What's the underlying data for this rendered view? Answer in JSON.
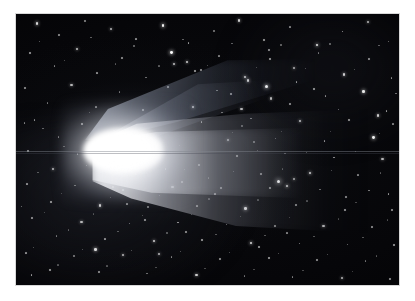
{
  "page": {
    "background_color": "#ffffff",
    "width": 415,
    "height": 301
  },
  "photo": {
    "subject": "comet",
    "description": "Long-exposure astrophotograph of a bright comet with a brilliant coma and two tails against a dense star field",
    "frame": {
      "left": 16,
      "top": 14,
      "width": 383,
      "height": 271
    },
    "sky_color": "#030305",
    "comet_color": "#ffffff",
    "artifacts": {
      "scanline_color": "#80848e"
    }
  },
  "comet": {
    "coma": {
      "cx_pct": 28,
      "cy_pct": 50,
      "color": "#ffffff"
    },
    "tails": [
      {
        "name": "dust-tail",
        "direction": "right",
        "brightness": "bright"
      },
      {
        "name": "ion-tail",
        "direction": "upper-right",
        "brightness": "faint"
      }
    ]
  },
  "starfield": {
    "count": 260,
    "color": "#ffffff",
    "stars": [
      [
        5.2,
        3.1,
        1.6,
        0.85
      ],
      [
        11.0,
        7.4,
        1.2,
        0.6
      ],
      [
        17.8,
        2.2,
        1.0,
        0.5
      ],
      [
        24.5,
        5.0,
        1.4,
        0.7
      ],
      [
        31.2,
        8.8,
        1.1,
        0.55
      ],
      [
        38.0,
        3.6,
        1.8,
        0.95
      ],
      [
        44.8,
        10.2,
        1.2,
        0.6
      ],
      [
        51.5,
        5.9,
        1.0,
        0.45
      ],
      [
        58.0,
        2.0,
        1.5,
        0.8
      ],
      [
        64.6,
        9.3,
        1.3,
        0.65
      ],
      [
        71.4,
        4.4,
        1.1,
        0.5
      ],
      [
        78.2,
        11.0,
        1.7,
        0.9
      ],
      [
        85.0,
        6.1,
        1.2,
        0.6
      ],
      [
        91.6,
        2.7,
        1.4,
        0.7
      ],
      [
        97.0,
        9.8,
        1.0,
        0.45
      ],
      [
        3.4,
        14.2,
        1.3,
        0.65
      ],
      [
        9.8,
        19.0,
        1.0,
        0.5
      ],
      [
        15.6,
        12.5,
        1.5,
        0.75
      ],
      [
        21.0,
        21.4,
        1.1,
        0.55
      ],
      [
        27.5,
        16.0,
        1.2,
        0.6
      ],
      [
        33.8,
        23.1,
        1.0,
        0.45
      ],
      [
        40.2,
        13.7,
        1.9,
        1.0
      ],
      [
        46.6,
        20.5,
        1.3,
        0.65
      ],
      [
        52.8,
        15.2,
        1.1,
        0.5
      ],
      [
        59.4,
        22.8,
        1.6,
        0.85
      ],
      [
        65.8,
        12.9,
        1.2,
        0.6
      ],
      [
        72.2,
        19.6,
        1.4,
        0.7
      ],
      [
        78.8,
        14.1,
        1.0,
        0.45
      ],
      [
        85.4,
        21.9,
        1.5,
        0.8
      ],
      [
        92.0,
        16.4,
        1.2,
        0.6
      ],
      [
        97.8,
        23.4,
        1.1,
        0.55
      ],
      [
        2.1,
        27.0,
        1.2,
        0.6
      ],
      [
        8.0,
        32.6,
        1.0,
        0.45
      ],
      [
        14.2,
        25.8,
        1.4,
        0.7
      ],
      [
        20.6,
        34.0,
        1.1,
        0.5
      ],
      [
        26.8,
        28.4,
        1.0,
        0.45
      ],
      [
        32.9,
        35.2,
        1.3,
        0.65
      ],
      [
        39.4,
        26.5,
        1.2,
        0.6
      ],
      [
        45.9,
        33.8,
        1.6,
        0.85
      ],
      [
        52.2,
        27.9,
        1.1,
        0.5
      ],
      [
        58.6,
        34.6,
        1.4,
        0.7
      ],
      [
        64.9,
        26.1,
        2.0,
        1.0
      ],
      [
        71.3,
        33.0,
        1.2,
        0.6
      ],
      [
        77.6,
        27.4,
        1.3,
        0.65
      ],
      [
        84.0,
        34.9,
        1.0,
        0.45
      ],
      [
        90.4,
        28.0,
        1.7,
        0.9
      ],
      [
        96.5,
        35.5,
        1.2,
        0.6
      ],
      [
        4.6,
        38.9,
        1.1,
        0.55
      ],
      [
        10.9,
        45.2,
        1.0,
        0.45
      ],
      [
        17.0,
        40.1,
        1.3,
        0.65
      ],
      [
        48.2,
        39.4,
        1.2,
        0.6
      ],
      [
        55.0,
        46.0,
        1.4,
        0.7
      ],
      [
        61.2,
        38.2,
        1.1,
        0.5
      ],
      [
        67.5,
        45.6,
        1.0,
        0.45
      ],
      [
        73.9,
        39.0,
        1.5,
        0.8
      ],
      [
        80.3,
        46.4,
        1.2,
        0.6
      ],
      [
        86.6,
        38.6,
        1.3,
        0.65
      ],
      [
        93.0,
        45.0,
        1.8,
        0.95
      ],
      [
        98.2,
        40.4,
        1.1,
        0.5
      ],
      [
        3.0,
        50.2,
        1.2,
        0.6
      ],
      [
        9.4,
        56.8,
        1.4,
        0.7
      ],
      [
        15.8,
        51.4,
        1.0,
        0.45
      ],
      [
        22.0,
        58.0,
        1.1,
        0.55
      ],
      [
        57.4,
        52.0,
        1.3,
        0.65
      ],
      [
        63.8,
        58.6,
        1.2,
        0.6
      ],
      [
        70.0,
        51.2,
        1.0,
        0.45
      ],
      [
        76.4,
        58.2,
        1.6,
        0.85
      ],
      [
        82.8,
        52.6,
        1.2,
        0.6
      ],
      [
        89.0,
        59.0,
        1.1,
        0.5
      ],
      [
        95.4,
        53.2,
        1.4,
        0.7
      ],
      [
        2.6,
        62.4,
        1.1,
        0.55
      ],
      [
        8.8,
        68.9,
        1.3,
        0.65
      ],
      [
        15.2,
        63.0,
        1.0,
        0.45
      ],
      [
        21.6,
        70.2,
        1.5,
        0.8
      ],
      [
        27.8,
        64.6,
        1.2,
        0.6
      ],
      [
        34.2,
        71.0,
        1.0,
        0.45
      ],
      [
        40.6,
        63.4,
        1.4,
        0.7
      ],
      [
        47.0,
        70.6,
        1.1,
        0.5
      ],
      [
        53.2,
        64.0,
        1.2,
        0.6
      ],
      [
        59.6,
        71.4,
        1.7,
        0.9
      ],
      [
        66.0,
        63.8,
        1.3,
        0.65
      ],
      [
        68.2,
        61.2,
        2.1,
        1.0
      ],
      [
        70.5,
        63.0,
        1.6,
        0.85
      ],
      [
        72.4,
        60.4,
        1.4,
        0.7
      ],
      [
        72.8,
        70.0,
        1.2,
        0.6
      ],
      [
        79.2,
        64.4,
        1.0,
        0.45
      ],
      [
        85.6,
        71.8,
        1.3,
        0.65
      ],
      [
        92.0,
        64.8,
        1.1,
        0.5
      ],
      [
        98.0,
        72.0,
        1.2,
        0.6
      ],
      [
        4.0,
        75.0,
        1.2,
        0.6
      ],
      [
        10.4,
        81.6,
        1.0,
        0.45
      ],
      [
        16.8,
        76.2,
        1.4,
        0.7
      ],
      [
        23.0,
        82.8,
        1.1,
        0.55
      ],
      [
        29.4,
        77.0,
        1.0,
        0.45
      ],
      [
        35.8,
        83.4,
        1.5,
        0.8
      ],
      [
        42.0,
        76.6,
        1.2,
        0.6
      ],
      [
        48.4,
        83.0,
        1.3,
        0.65
      ],
      [
        54.8,
        77.4,
        1.0,
        0.45
      ],
      [
        61.0,
        84.0,
        1.6,
        0.85
      ],
      [
        67.4,
        78.0,
        1.2,
        0.6
      ],
      [
        73.8,
        84.4,
        1.1,
        0.5
      ],
      [
        80.0,
        77.8,
        1.4,
        0.7
      ],
      [
        86.4,
        84.8,
        1.0,
        0.45
      ],
      [
        92.8,
        78.4,
        1.2,
        0.6
      ],
      [
        98.4,
        85.0,
        1.3,
        0.65
      ],
      [
        2.4,
        88.0,
        1.1,
        0.55
      ],
      [
        8.6,
        94.2,
        1.3,
        0.65
      ],
      [
        15.0,
        89.0,
        1.0,
        0.45
      ],
      [
        21.4,
        95.0,
        1.2,
        0.6
      ],
      [
        27.6,
        88.6,
        1.4,
        0.7
      ],
      [
        34.0,
        95.4,
        1.0,
        0.45
      ],
      [
        40.4,
        89.4,
        1.1,
        0.5
      ],
      [
        46.8,
        96.0,
        1.5,
        0.8
      ],
      [
        53.0,
        90.0,
        1.2,
        0.6
      ],
      [
        59.4,
        96.4,
        1.0,
        0.45
      ],
      [
        65.8,
        89.8,
        1.3,
        0.65
      ],
      [
        72.0,
        96.8,
        1.1,
        0.5
      ],
      [
        78.4,
        90.4,
        1.2,
        0.6
      ],
      [
        84.8,
        97.0,
        1.4,
        0.7
      ],
      [
        91.0,
        90.8,
        1.0,
        0.45
      ],
      [
        97.4,
        97.4,
        1.2,
        0.6
      ],
      [
        6.8,
        42.0,
        1.0,
        0.4
      ],
      [
        12.4,
        48.6,
        0.9,
        0.35
      ],
      [
        19.0,
        36.2,
        0.9,
        0.35
      ],
      [
        25.4,
        42.8,
        0.8,
        0.3
      ],
      [
        36.0,
        55.0,
        0.9,
        0.35
      ],
      [
        42.6,
        48.4,
        0.8,
        0.3
      ],
      [
        50.0,
        60.2,
        0.9,
        0.35
      ],
      [
        56.4,
        43.6,
        0.8,
        0.3
      ],
      [
        62.8,
        50.0,
        0.9,
        0.35
      ],
      [
        69.2,
        43.2,
        0.8,
        0.3
      ],
      [
        75.6,
        50.8,
        0.9,
        0.35
      ],
      [
        82.0,
        43.0,
        0.8,
        0.3
      ],
      [
        88.4,
        50.4,
        0.9,
        0.35
      ],
      [
        94.8,
        43.8,
        0.8,
        0.3
      ],
      [
        5.6,
        58.2,
        0.9,
        0.35
      ],
      [
        11.8,
        66.0,
        0.8,
        0.3
      ],
      [
        18.2,
        55.6,
        0.9,
        0.35
      ],
      [
        24.6,
        67.4,
        0.8,
        0.3
      ],
      [
        31.0,
        58.8,
        0.9,
        0.35
      ],
      [
        37.4,
        66.8,
        0.8,
        0.3
      ],
      [
        43.8,
        57.2,
        0.9,
        0.35
      ],
      [
        50.2,
        68.0,
        0.8,
        0.3
      ],
      [
        56.6,
        57.8,
        0.9,
        0.35
      ],
      [
        63.0,
        68.4,
        0.8,
        0.3
      ],
      [
        69.4,
        57.0,
        0.9,
        0.35
      ],
      [
        75.8,
        68.8,
        0.8,
        0.3
      ],
      [
        82.2,
        57.6,
        0.9,
        0.35
      ],
      [
        88.6,
        69.2,
        0.8,
        0.3
      ],
      [
        95.0,
        58.4,
        0.9,
        0.35
      ],
      [
        7.2,
        73.0,
        0.8,
        0.3
      ],
      [
        13.6,
        79.4,
        0.9,
        0.35
      ],
      [
        20.0,
        73.6,
        0.8,
        0.3
      ],
      [
        26.4,
        80.0,
        0.9,
        0.35
      ],
      [
        32.8,
        74.2,
        0.8,
        0.3
      ],
      [
        39.2,
        80.6,
        0.9,
        0.35
      ],
      [
        45.6,
        73.8,
        0.8,
        0.3
      ],
      [
        52.0,
        81.0,
        0.9,
        0.35
      ],
      [
        58.4,
        74.6,
        0.8,
        0.3
      ],
      [
        64.8,
        81.4,
        0.9,
        0.35
      ],
      [
        71.2,
        75.0,
        0.8,
        0.3
      ],
      [
        77.6,
        81.8,
        0.9,
        0.35
      ],
      [
        84.0,
        75.4,
        0.8,
        0.3
      ],
      [
        90.4,
        82.2,
        0.9,
        0.35
      ],
      [
        96.8,
        75.8,
        0.8,
        0.3
      ],
      [
        4.4,
        86.0,
        0.9,
        0.35
      ],
      [
        10.8,
        92.4,
        0.8,
        0.3
      ],
      [
        17.2,
        86.6,
        0.9,
        0.35
      ],
      [
        23.6,
        92.8,
        0.8,
        0.3
      ],
      [
        30.0,
        87.0,
        0.9,
        0.35
      ],
      [
        36.4,
        93.2,
        0.8,
        0.3
      ],
      [
        42.8,
        87.4,
        0.9,
        0.35
      ],
      [
        49.2,
        93.6,
        0.8,
        0.3
      ],
      [
        55.6,
        87.8,
        0.9,
        0.35
      ],
      [
        62.0,
        94.0,
        0.8,
        0.3
      ],
      [
        68.4,
        88.2,
        0.9,
        0.35
      ],
      [
        74.8,
        94.4,
        0.8,
        0.3
      ],
      [
        81.2,
        88.6,
        0.9,
        0.35
      ],
      [
        87.6,
        94.8,
        0.8,
        0.3
      ],
      [
        94.0,
        89.0,
        0.9,
        0.35
      ],
      [
        6.0,
        10.0,
        0.9,
        0.4
      ],
      [
        12.6,
        16.8,
        0.8,
        0.35
      ],
      [
        19.4,
        8.4,
        0.9,
        0.4
      ],
      [
        25.8,
        18.2,
        0.8,
        0.35
      ],
      [
        30.6,
        11.6,
        0.9,
        0.4
      ],
      [
        37.2,
        19.0,
        0.8,
        0.35
      ],
      [
        43.4,
        9.2,
        0.9,
        0.4
      ],
      [
        49.8,
        18.8,
        0.8,
        0.35
      ],
      [
        56.2,
        10.6,
        0.9,
        0.4
      ],
      [
        62.6,
        19.4,
        0.8,
        0.35
      ],
      [
        69.0,
        11.2,
        0.9,
        0.4
      ],
      [
        75.4,
        19.8,
        0.8,
        0.35
      ],
      [
        81.8,
        10.8,
        0.9,
        0.4
      ],
      [
        88.2,
        20.2,
        0.8,
        0.35
      ],
      [
        94.6,
        11.4,
        0.9,
        0.4
      ],
      [
        41.0,
        18.0,
        1.4,
        0.75
      ],
      [
        44.4,
        17.2,
        1.5,
        0.8
      ],
      [
        48.0,
        20.4,
        1.2,
        0.6
      ],
      [
        60.2,
        24.0,
        1.6,
        0.85
      ],
      [
        55.8,
        29.2,
        1.3,
        0.65
      ],
      [
        66.4,
        30.8,
        1.4,
        0.7
      ],
      [
        30.2,
        46.0,
        1.0,
        0.5
      ],
      [
        34.6,
        52.4,
        0.9,
        0.4
      ],
      [
        38.8,
        57.0,
        1.1,
        0.55
      ],
      [
        43.0,
        61.8,
        1.2,
        0.6
      ],
      [
        47.6,
        55.4,
        1.0,
        0.5
      ],
      [
        51.8,
        66.2,
        1.1,
        0.55
      ],
      [
        25.0,
        63.4,
        1.3,
        0.65
      ],
      [
        28.8,
        69.8,
        1.1,
        0.5
      ],
      [
        33.4,
        75.6,
        1.2,
        0.6
      ],
      [
        20.4,
        86.4,
        1.6,
        0.85
      ],
      [
        37.0,
        88.2,
        1.4,
        0.7
      ],
      [
        44.2,
        80.0,
        1.2,
        0.6
      ],
      [
        63.2,
        85.6,
        1.3,
        0.65
      ],
      [
        70.6,
        80.4,
        1.1,
        0.5
      ],
      [
        86.0,
        67.2,
        1.2,
        0.6
      ],
      [
        94.2,
        37.0,
        1.5,
        0.8
      ],
      [
        97.0,
        66.0,
        1.2,
        0.6
      ],
      [
        99.0,
        29.0,
        1.0,
        0.45
      ],
      [
        2.0,
        40.0,
        1.1,
        0.5
      ],
      [
        1.2,
        70.8,
        1.0,
        0.45
      ],
      [
        3.8,
        96.0,
        1.2,
        0.6
      ],
      [
        66.0,
        16.4,
        1.3,
        0.65
      ],
      [
        73.0,
        24.6,
        1.2,
        0.6
      ],
      [
        80.6,
        30.0,
        1.1,
        0.55
      ],
      [
        53.6,
        36.0,
        1.0,
        0.45
      ],
      [
        58.8,
        41.0,
        0.9,
        0.4
      ],
      [
        62.0,
        47.0,
        1.0,
        0.45
      ]
    ]
  }
}
